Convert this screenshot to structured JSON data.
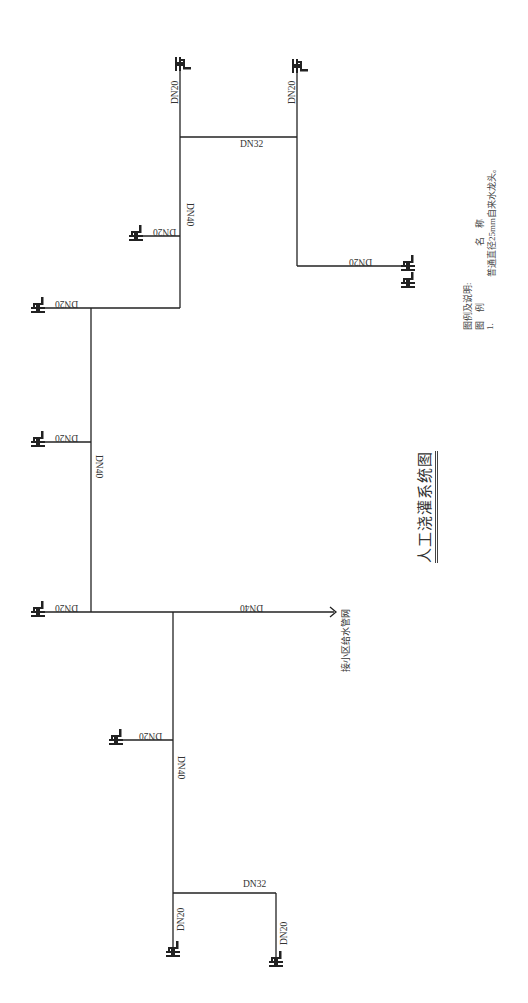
{
  "title": "人工浇灌系统图",
  "inlet_label": "接小区给水管网",
  "legend": {
    "heading": "图例及说明:",
    "col_symbol": "图　例",
    "col_name": "名　称",
    "item_no": "1.",
    "item_desc": "普通直径25mm自来水龙头。",
    "icon": "faucet-icon"
  },
  "pipes": {
    "top_riser_left": "DN20",
    "top_riser_right": "DN20",
    "top_cross": "DN32",
    "upper_main": "DN40",
    "upper_branch": "DN20",
    "upper_right_branch": "DN20",
    "mid_branch_top": "DN20",
    "mid_main": "DN40",
    "mid_branch": "DN20",
    "bottom_branch": "DN20",
    "inlet": "DN40",
    "lower_branch": "DN20",
    "lower_main": "DN40",
    "bottom_cross": "DN32",
    "bottom_riser_left": "DN20",
    "bottom_riser_right": "DN20"
  },
  "colors": {
    "line": "#222222",
    "text": "#333333",
    "background": "#ffffff"
  }
}
